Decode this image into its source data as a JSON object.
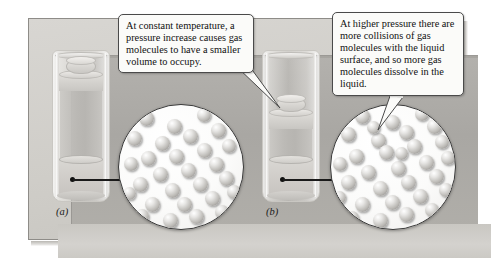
{
  "figure": {
    "background_color": "#ffffff",
    "panel_color": "#d2d0cc",
    "recess_color": "#aeaca8",
    "molecule_color": "#c0bebb",
    "outline_color": "#3b3b3b"
  },
  "callouts": [
    {
      "id": "left-callout",
      "text": "At constant temperature, a pressure increase causes gas molecules to have a smaller volume to occupy.",
      "points_to": "right-cylinder-gas"
    },
    {
      "id": "right-callout",
      "text": "At higher pressure there are more collisions of gas molecules with the liquid surface, and so more gas molecules dissolve in the liquid.",
      "points_to": "right-magnifier"
    }
  ],
  "panels": [
    {
      "id": "a",
      "label": "(a)",
      "state": "lower pressure, larger gas volume"
    },
    {
      "id": "b",
      "label": "(b)",
      "state": "higher pressure, smaller gas volume"
    }
  ],
  "magnifiers": [
    {
      "id": "left-magnifier",
      "source": "(a)",
      "molecule_count": 34
    },
    {
      "id": "right-magnifier",
      "source": "(b)",
      "molecule_count": 40
    }
  ],
  "molecule_layout": {
    "left": [
      [
        20,
        6,
        15
      ],
      [
        48,
        14,
        15
      ],
      [
        78,
        3,
        14
      ],
      [
        8,
        26,
        15
      ],
      [
        36,
        31,
        15
      ],
      [
        64,
        24,
        15
      ],
      [
        92,
        18,
        15
      ],
      [
        22,
        46,
        15
      ],
      [
        50,
        44,
        15
      ],
      [
        78,
        38,
        15
      ],
      [
        103,
        34,
        14
      ],
      [
        5,
        52,
        14
      ],
      [
        34,
        62,
        15
      ],
      [
        62,
        58,
        15
      ],
      [
        90,
        52,
        15
      ],
      [
        14,
        72,
        15
      ],
      [
        46,
        78,
        15
      ],
      [
        74,
        72,
        15
      ],
      [
        100,
        66,
        15
      ],
      [
        4,
        82,
        13
      ],
      [
        26,
        92,
        15
      ],
      [
        58,
        92,
        15
      ],
      [
        86,
        86,
        15
      ],
      [
        108,
        80,
        14
      ],
      [
        16,
        104,
        14
      ],
      [
        44,
        108,
        15
      ],
      [
        70,
        104,
        15
      ],
      [
        96,
        100,
        14
      ],
      [
        30,
        122,
        14
      ],
      [
        58,
        124,
        14
      ],
      [
        84,
        118,
        14
      ],
      [
        104,
        112,
        13
      ],
      [
        46,
        138,
        13
      ],
      [
        72,
        136,
        13
      ]
    ],
    "right": [
      [
        24,
        4,
        15
      ],
      [
        54,
        10,
        15
      ],
      [
        84,
        2,
        14
      ],
      [
        10,
        22,
        15
      ],
      [
        40,
        28,
        15
      ],
      [
        68,
        20,
        15
      ],
      [
        96,
        14,
        15
      ],
      [
        18,
        44,
        15
      ],
      [
        48,
        40,
        15
      ],
      [
        76,
        34,
        15
      ],
      [
        104,
        30,
        14
      ],
      [
        2,
        52,
        14
      ],
      [
        30,
        60,
        15
      ],
      [
        60,
        56,
        15
      ],
      [
        88,
        50,
        15
      ],
      [
        110,
        46,
        14
      ],
      [
        10,
        70,
        15
      ],
      [
        42,
        76,
        15
      ],
      [
        70,
        70,
        15
      ],
      [
        98,
        64,
        15
      ],
      [
        2,
        86,
        13
      ],
      [
        24,
        92,
        15
      ],
      [
        54,
        90,
        15
      ],
      [
        82,
        84,
        15
      ],
      [
        108,
        78,
        14
      ],
      [
        14,
        106,
        14
      ],
      [
        42,
        108,
        15
      ],
      [
        68,
        102,
        15
      ],
      [
        94,
        98,
        14
      ],
      [
        114,
        92,
        13
      ],
      [
        28,
        122,
        14
      ],
      [
        56,
        124,
        14
      ],
      [
        82,
        118,
        14
      ],
      [
        102,
        112,
        13
      ],
      [
        44,
        138,
        13
      ],
      [
        70,
        136,
        13
      ],
      [
        92,
        132,
        13
      ],
      [
        36,
        16,
        13
      ],
      [
        64,
        42,
        13
      ],
      [
        16,
        132,
        12
      ]
    ]
  }
}
